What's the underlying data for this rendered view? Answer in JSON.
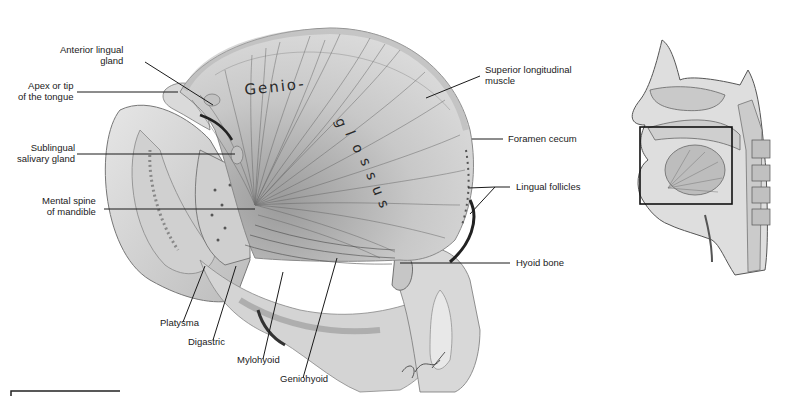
{
  "figure": {
    "handwritten_label": "Genio-glossus",
    "signature": "signature"
  },
  "labels": {
    "anterior_lingual_gland": "Anterior lingual\ngland",
    "apex": "Apex or tip\nof the tongue",
    "sublingual": "Sublingual\nsalivary gland",
    "mental_spine": "Mental spine\nof mandible",
    "superior_longitudinal": "Superior longitudinal\nmuscle",
    "foramen_cecum": "Foramen cecum",
    "lingual_follicles": "Lingual follicles",
    "hyoid_bone": "Hyoid bone",
    "platysma": "Platysma",
    "digastric": "Digastric",
    "mylohyoid": "Mylohyoid",
    "geniohyoid": "Geniohyoid"
  },
  "inset": {
    "description": "Sagittal head and neck overview with boxed region of tongue",
    "vertebra_labels": [
      "C1",
      "C2",
      "C3",
      "C4"
    ]
  },
  "colors": {
    "line": "#1a1a1a",
    "tissue_light": "#dcdcdc",
    "tissue_mid": "#bdbdbd",
    "tissue_dark": "#7a7a7a"
  }
}
